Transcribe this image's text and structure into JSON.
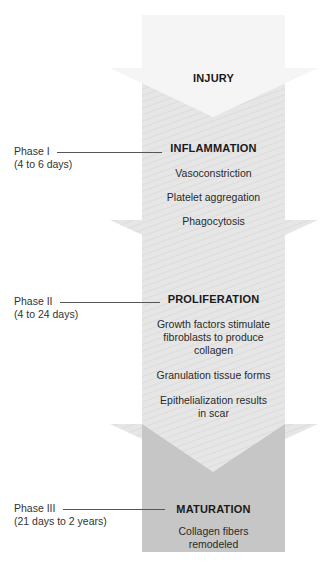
{
  "stages": [
    {
      "title": "INJURY",
      "items": []
    },
    {
      "title": "INFLAMMATION",
      "items": [
        "Vasoconstriction",
        "Platelet aggregation",
        "Phagocytosis"
      ]
    },
    {
      "title": "PROLIFERATION",
      "items": [
        "Growth factors stimulate fibroblasts to produce collagen",
        "Granulation tissue forms",
        "Epithelialization results in scar"
      ]
    },
    {
      "title": "MATURATION",
      "items": [
        "Collagen fibers remodeled"
      ]
    }
  ],
  "phases": [
    {
      "label": "Phase I",
      "duration": "(4 to 6 days)"
    },
    {
      "label": "Phase II",
      "duration": "(4 to 24 days)"
    },
    {
      "label": "Phase III",
      "duration": "(21 days to 2 years)"
    }
  ],
  "colors": {
    "light_fill": "#ececec",
    "injury_fill": "#f6f6f6",
    "maturation_fill": "#c6c6c6",
    "leader_line": "#555555"
  }
}
